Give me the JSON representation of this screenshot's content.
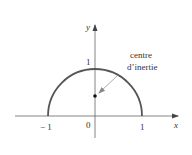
{
  "figure": {
    "axes": {
      "x_label": "x",
      "y_label": "y",
      "origin_label": "0",
      "x_ticks": [
        {
          "value": -1,
          "label": "− 1"
        },
        {
          "value": 1,
          "label": "1"
        }
      ],
      "y_ticks": [
        {
          "value": 1,
          "label": "1"
        }
      ]
    },
    "curve": {
      "description": "upper semicircle of radius 1 centred at origin",
      "radius": 1,
      "x_range": [
        -1,
        1
      ],
      "color": "#555555"
    },
    "centroid": {
      "x": 0,
      "y": 0.424,
      "annotation_line1": "centre",
      "annotation_line2": "d’inertie"
    },
    "colors": {
      "axis": "#666666",
      "arrow": "#888888",
      "point": "#111111"
    }
  }
}
